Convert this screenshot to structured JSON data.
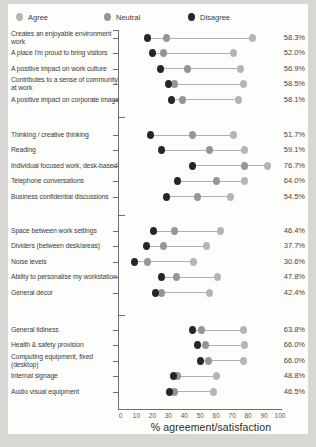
{
  "colors": {
    "frame_bg": "#d8d7d3",
    "card_bg": "#fdfdfb",
    "agree": "#b5b5b3",
    "neutral": "#959593",
    "disagree": "#262626",
    "connector": "#b0b0ae",
    "axis": "#6e6e6c",
    "label_text": "#3c3c3a",
    "value_text": "#454543",
    "tick_text": "#5a5a58",
    "title_text": "#2b2b29"
  },
  "legend": {
    "items": [
      {
        "key": "agree",
        "label": "Agree"
      },
      {
        "key": "neutral",
        "label": "Neutral"
      },
      {
        "key": "disagree",
        "label": "Disagree"
      }
    ]
  },
  "x_axis": {
    "title": "% agreement/satisfaction",
    "ticks": [
      0,
      10,
      20,
      30,
      40,
      50,
      60,
      70,
      80,
      90,
      100
    ],
    "min": 0,
    "max": 100
  },
  "chart_data": {
    "type": "scatter",
    "subtype": "dumbbell-dot-plot",
    "series_names": [
      "Agree",
      "Neutral",
      "Disagree"
    ],
    "xlabel": "% agreement/satisfaction",
    "xlim": [
      0,
      100
    ],
    "grid": false,
    "legend_position": "top-left",
    "groups": [
      {
        "rows": [
          {
            "label": "Creates an enjoyable environment work",
            "disagree": 17,
            "neutral": 29,
            "agree": 83,
            "value_label": "58.3%"
          },
          {
            "label": "A place I'm proud to bring visitors",
            "disagree": 20,
            "neutral": 27,
            "agree": 71,
            "value_label": "52.0%"
          },
          {
            "label": "A positive impact on work culture",
            "disagree": 25,
            "neutral": 42,
            "agree": 75,
            "value_label": "56.9%"
          },
          {
            "label": "Contributes to a sense of community at work",
            "disagree": 30,
            "neutral": 34,
            "agree": 77,
            "value_label": "58.5%"
          },
          {
            "label": "A positive impact on corporate image",
            "disagree": 32,
            "neutral": 39,
            "agree": 74,
            "value_label": "58.1%"
          }
        ]
      },
      {
        "rows": [
          {
            "label": "Thinking / creative thinking",
            "disagree": 19,
            "neutral": 45,
            "agree": 71,
            "value_label": "51.7%"
          },
          {
            "label": "Reading",
            "disagree": 26,
            "neutral": 56,
            "agree": 78,
            "value_label": "59.1%"
          },
          {
            "label": "Individual focused work, desk-based",
            "disagree": 45,
            "neutral": 78,
            "agree": 92,
            "value_label": "76.7%"
          },
          {
            "label": "Telephone conversations",
            "disagree": 36,
            "neutral": 60,
            "agree": 78,
            "value_label": "64.0%"
          },
          {
            "label": "Business confidential discussions",
            "disagree": 29,
            "neutral": 48,
            "agree": 69,
            "value_label": "54.5%"
          }
        ]
      },
      {
        "rows": [
          {
            "label": "Space between work settings",
            "disagree": 21,
            "neutral": 34,
            "agree": 63,
            "value_label": "46.4%"
          },
          {
            "label": "Dividers (between desk/areas)",
            "disagree": 16,
            "neutral": 27,
            "agree": 54,
            "value_label": "37.7%"
          },
          {
            "label": "Noise levels",
            "disagree": 9,
            "neutral": 17,
            "agree": 46,
            "value_label": "30.6%"
          },
          {
            "label": "Ability to personalise my workstation",
            "disagree": 26,
            "neutral": 35,
            "agree": 61,
            "value_label": "47.8%"
          },
          {
            "label": "General décor",
            "disagree": 22,
            "neutral": 26,
            "agree": 56,
            "value_label": "42.4%"
          }
        ]
      },
      {
        "rows": [
          {
            "label": "General tidiness",
            "disagree": 45,
            "neutral": 51,
            "agree": 77,
            "value_label": "63.8%"
          },
          {
            "label": "Health & safety provision",
            "disagree": 48,
            "neutral": 53,
            "agree": 78,
            "value_label": "66.0%"
          },
          {
            "label": "Computing equipment, fixed (desktop)",
            "disagree": 50,
            "neutral": 55,
            "agree": 77,
            "value_label": "66.0%"
          },
          {
            "label": "Internal signage",
            "disagree": 33,
            "neutral": 36,
            "agree": 60,
            "value_label": "48.8%"
          },
          {
            "label": "Audio visual equipment",
            "disagree": 31,
            "neutral": 34,
            "agree": 58,
            "value_label": "46.5%"
          }
        ]
      }
    ]
  }
}
